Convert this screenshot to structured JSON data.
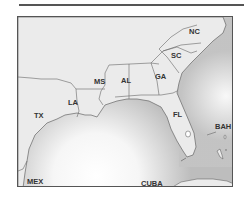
{
  "map": {
    "region": "Southeastern United States",
    "colors": {
      "land": "#ebebeb",
      "water_light": "#ffffff",
      "water_dark": "#bdbdbd",
      "border": "#666666",
      "frame": "#555555"
    },
    "labels": {
      "nc": "NC",
      "sc": "SC",
      "ga": "GA",
      "al": "AL",
      "ms": "MS",
      "la": "LA",
      "tx": "TX",
      "fl": "FL",
      "bah": "BAH",
      "mex": "MEX",
      "cuba": "CUBA"
    }
  }
}
